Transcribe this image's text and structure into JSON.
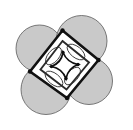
{
  "figure": {
    "canvas": {
      "width": 133,
      "height": 130,
      "background": "#ffffff"
    },
    "colors": {
      "circle_fill": "#c9c9c9",
      "circle_stroke": "#5a5a5a",
      "square_stroke": "#111111",
      "inner_stroke": "#2b2b2b",
      "arc_stroke": "#3a3a3a",
      "vertex_dot": "#0d0d0d",
      "white_fill": "#ffffff"
    },
    "stroke_widths": {
      "outer_square": 2.6,
      "inner_square": 1.9,
      "center_square": 1.7,
      "arc": 0.9,
      "circle": 0.8
    },
    "outer_square": {
      "label": "outer-tilted-square",
      "rotation_degrees": 12,
      "vertices": [
        {
          "name": "top",
          "x": 62.5,
          "y": 30.5
        },
        {
          "name": "right",
          "x": 98.5,
          "y": 60.0
        },
        {
          "name": "bottom",
          "x": 67.0,
          "y": 98.0
        },
        {
          "name": "left",
          "x": 30.0,
          "y": 71.5
        }
      ],
      "edge_midpoints": [
        {
          "name": "top-right-edge",
          "x": 80.5,
          "y": 45.3
        },
        {
          "name": "bottom-right-edge",
          "x": 82.8,
          "y": 79.0
        },
        {
          "name": "bottom-left-edge",
          "x": 48.5,
          "y": 84.8
        },
        {
          "name": "top-left-edge",
          "x": 46.3,
          "y": 51.0
        }
      ]
    },
    "circles": [
      {
        "name": "circle-top-right",
        "cx": 81.5,
        "cy": 41.0,
        "r": 25.5
      },
      {
        "name": "circle-bottom-right",
        "cx": 89.0,
        "cy": 81.0,
        "r": 23.5
      },
      {
        "name": "circle-bottom-left",
        "cx": 46.0,
        "cy": 89.5,
        "r": 25.0
      },
      {
        "name": "circle-top-left",
        "cx": 39.5,
        "cy": 48.5,
        "r": 23.5
      }
    ],
    "inner_square": {
      "label": "inner-tilted-square",
      "vertices": [
        {
          "x": 62.5,
          "y": 41.0
        },
        {
          "x": 89.0,
          "y": 62.5
        },
        {
          "x": 66.5,
          "y": 89.5
        },
        {
          "x": 40.5,
          "y": 69.5
        }
      ]
    },
    "center_square": {
      "label": "central-concave-square",
      "vertices": [
        {
          "x": 63.0,
          "y": 52.5
        },
        {
          "x": 78.0,
          "y": 64.5
        },
        {
          "x": 66.0,
          "y": 78.5
        },
        {
          "x": 51.5,
          "y": 66.5
        }
      ],
      "side_curvature": "concave-inward",
      "bulge": 2.6
    },
    "arc_petals": [
      {
        "name": "petal-top-right",
        "cx": 76.0,
        "cy": 52.0,
        "rx": 10.5,
        "ry": 5.5,
        "rotate": 39
      },
      {
        "name": "petal-bottom-right",
        "cx": 72.5,
        "cy": 76.0,
        "rx": 10.5,
        "ry": 5.5,
        "rotate": -50
      },
      {
        "name": "petal-bottom-left",
        "cx": 54.0,
        "cy": 79.0,
        "rx": 10.5,
        "ry": 5.5,
        "rotate": 39
      },
      {
        "name": "petal-top-left",
        "cx": 53.5,
        "cy": 56.0,
        "rx": 10.5,
        "ry": 5.5,
        "rotate": -50
      }
    ],
    "vertex_dots": [
      {
        "name": "dot-top",
        "x": 62.5,
        "y": 30.5,
        "r": 2.2
      },
      {
        "name": "dot-right",
        "x": 98.5,
        "y": 60.0,
        "r": 2.2
      },
      {
        "name": "dot-bottom",
        "x": 67.0,
        "y": 98.0,
        "r": 2.2
      },
      {
        "name": "dot-left",
        "x": 30.0,
        "y": 71.5,
        "r": 2.2
      }
    ],
    "center_dots": [
      {
        "name": "center-dot-top",
        "x": 63.0,
        "y": 52.5,
        "r": 1.7
      },
      {
        "name": "center-dot-right",
        "x": 78.0,
        "y": 64.5,
        "r": 1.7
      },
      {
        "name": "center-dot-bottom",
        "x": 66.0,
        "y": 78.5,
        "r": 1.7
      },
      {
        "name": "center-dot-left",
        "x": 51.5,
        "y": 66.5,
        "r": 1.7
      }
    ]
  }
}
